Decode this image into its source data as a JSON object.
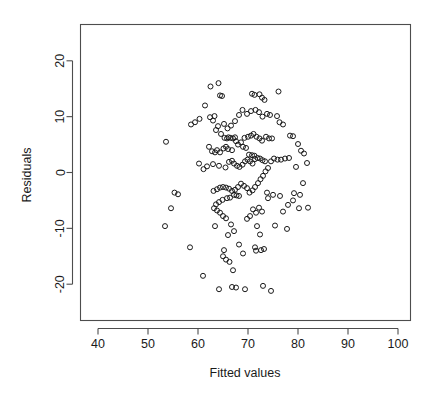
{
  "chart_data": {
    "type": "scatter",
    "title": "",
    "xlabel": "Fitted values",
    "ylabel": "Residuals",
    "xlim": [
      36.5,
      102.5
    ],
    "ylim": [
      -26.5,
      26.5
    ],
    "xticks": [
      40,
      50,
      60,
      70,
      80,
      90,
      100
    ],
    "yticks": [
      -20,
      -10,
      0,
      10,
      20
    ],
    "grid": false,
    "legend": null,
    "marker": "open-circle",
    "marker_color": "#1a1a1a",
    "n_points": 181,
    "points": [
      [
        53.6,
        5.5
      ],
      [
        55.3,
        -3.6
      ],
      [
        56.0,
        -3.9
      ],
      [
        54.6,
        -6.4
      ],
      [
        53.4,
        -9.6
      ],
      [
        58.4,
        -13.4
      ],
      [
        61.0,
        -18.5
      ],
      [
        58.6,
        8.6
      ],
      [
        59.4,
        9.0
      ],
      [
        60.3,
        9.6
      ],
      [
        61.4,
        12.0
      ],
      [
        62.5,
        15.4
      ],
      [
        63.3,
        10.1
      ],
      [
        62.4,
        9.9
      ],
      [
        63.0,
        9.3
      ],
      [
        64.1,
        16.0
      ],
      [
        64.4,
        13.8
      ],
      [
        64.8,
        13.7
      ],
      [
        65.2,
        8.7
      ],
      [
        64.0,
        8.3
      ],
      [
        63.6,
        7.6
      ],
      [
        64.6,
        6.9
      ],
      [
        65.3,
        6.2
      ],
      [
        65.8,
        6.1
      ],
      [
        66.1,
        6.3
      ],
      [
        66.5,
        6.2
      ],
      [
        67.0,
        6.1
      ],
      [
        67.4,
        6.3
      ],
      [
        62.2,
        4.6
      ],
      [
        62.8,
        3.8
      ],
      [
        63.4,
        3.6
      ],
      [
        63.8,
        4.0
      ],
      [
        64.4,
        3.6
      ],
      [
        65.1,
        4.3
      ],
      [
        65.6,
        4.6
      ],
      [
        66.0,
        4.2
      ],
      [
        66.8,
        4.0
      ],
      [
        60.2,
        1.6
      ],
      [
        61.1,
        0.6
      ],
      [
        61.8,
        1.1
      ],
      [
        63.0,
        1.5
      ],
      [
        64.2,
        1.2
      ],
      [
        65.5,
        0.9
      ],
      [
        66.2,
        1.9
      ],
      [
        66.8,
        2.1
      ],
      [
        67.2,
        1.6
      ],
      [
        67.8,
        1.2
      ],
      [
        68.3,
        1.0
      ],
      [
        68.9,
        1.4
      ],
      [
        69.4,
        2.0
      ],
      [
        69.9,
        2.3
      ],
      [
        70.4,
        2.0
      ],
      [
        70.9,
        1.6
      ],
      [
        71.4,
        2.4
      ],
      [
        71.9,
        2.6
      ],
      [
        72.4,
        2.5
      ],
      [
        72.9,
        2.2
      ],
      [
        73.4,
        2.0
      ],
      [
        69.0,
        4.6
      ],
      [
        69.6,
        4.4
      ],
      [
        70.2,
        3.2
      ],
      [
        70.8,
        3.1
      ],
      [
        71.3,
        3.0
      ],
      [
        68.0,
        5.0
      ],
      [
        67.6,
        5.6
      ],
      [
        68.6,
        5.4
      ],
      [
        69.3,
        6.2
      ],
      [
        70.0,
        6.4
      ],
      [
        70.6,
        6.6
      ],
      [
        71.1,
        6.9
      ],
      [
        71.7,
        6.4
      ],
      [
        72.3,
        6.1
      ],
      [
        72.8,
        5.7
      ],
      [
        73.6,
        6.4
      ],
      [
        74.2,
        6.1
      ],
      [
        74.8,
        6.1
      ],
      [
        78.4,
        6.6
      ],
      [
        79.0,
        6.5
      ],
      [
        77.0,
        8.6
      ],
      [
        75.8,
        10.1
      ],
      [
        76.3,
        9.0
      ],
      [
        74.4,
        10.3
      ],
      [
        73.8,
        10.5
      ],
      [
        72.9,
        10.0
      ],
      [
        72.2,
        10.8
      ],
      [
        71.5,
        11.2
      ],
      [
        70.6,
        11.0
      ],
      [
        69.8,
        10.5
      ],
      [
        68.9,
        11.2
      ],
      [
        68.2,
        10.3
      ],
      [
        67.4,
        9.2
      ],
      [
        66.6,
        8.4
      ],
      [
        65.9,
        7.9
      ],
      [
        70.8,
        14.1
      ],
      [
        71.3,
        13.9
      ],
      [
        72.3,
        14.0
      ],
      [
        72.8,
        13.4
      ],
      [
        73.3,
        13.0
      ],
      [
        76.1,
        14.5
      ],
      [
        80.0,
        5.1
      ],
      [
        80.6,
        3.9
      ],
      [
        81.2,
        3.4
      ],
      [
        81.8,
        1.7
      ],
      [
        79.6,
        1.0
      ],
      [
        78.2,
        2.6
      ],
      [
        77.4,
        2.5
      ],
      [
        76.6,
        2.3
      ],
      [
        75.9,
        2.3
      ],
      [
        75.2,
        2.5
      ],
      [
        74.6,
        2.0
      ],
      [
        74.0,
        0.8
      ],
      [
        73.5,
        0.2
      ],
      [
        73.0,
        -0.6
      ],
      [
        72.5,
        -1.2
      ],
      [
        72.0,
        -1.9
      ],
      [
        71.4,
        -2.6
      ],
      [
        70.9,
        -3.2
      ],
      [
        70.3,
        -3.6
      ],
      [
        69.8,
        -2.8
      ],
      [
        69.2,
        -2.4
      ],
      [
        68.6,
        -2.0
      ],
      [
        68.0,
        -2.6
      ],
      [
        67.4,
        -3.1
      ],
      [
        66.8,
        -3.3
      ],
      [
        66.2,
        -2.9
      ],
      [
        65.6,
        -2.7
      ],
      [
        65.0,
        -2.6
      ],
      [
        64.4,
        -2.7
      ],
      [
        63.8,
        -3.0
      ],
      [
        63.1,
        -3.3
      ],
      [
        67.2,
        -4.0
      ],
      [
        67.7,
        -4.1
      ],
      [
        68.2,
        -4.2
      ],
      [
        66.4,
        -4.5
      ],
      [
        65.8,
        -4.6
      ],
      [
        64.9,
        -4.9
      ],
      [
        64.2,
        -5.3
      ],
      [
        63.6,
        -5.7
      ],
      [
        63.2,
        -6.4
      ],
      [
        63.8,
        -6.8
      ],
      [
        64.4,
        -7.2
      ],
      [
        65.0,
        -7.8
      ],
      [
        65.6,
        -8.2
      ],
      [
        63.4,
        -9.6
      ],
      [
        66.6,
        -9.3
      ],
      [
        67.2,
        -10.5
      ],
      [
        66.0,
        -11.2
      ],
      [
        65.2,
        -13.9
      ],
      [
        65.0,
        -15.0
      ],
      [
        65.6,
        -15.6
      ],
      [
        66.3,
        -16.0
      ],
      [
        67.0,
        -17.5
      ],
      [
        64.2,
        -20.9
      ],
      [
        66.8,
        -20.5
      ],
      [
        67.6,
        -20.6
      ],
      [
        69.4,
        -20.9
      ],
      [
        73.0,
        -20.3
      ],
      [
        74.6,
        -21.2
      ],
      [
        69.0,
        -14.5
      ],
      [
        68.2,
        -12.9
      ],
      [
        69.8,
        -8.3
      ],
      [
        70.4,
        -7.8
      ],
      [
        71.0,
        -6.6
      ],
      [
        71.6,
        -7.2
      ],
      [
        72.2,
        -6.3
      ],
      [
        72.8,
        -7.0
      ],
      [
        71.8,
        -9.6
      ],
      [
        72.4,
        -11.1
      ],
      [
        71.4,
        -13.4
      ],
      [
        71.6,
        -14.0
      ],
      [
        72.6,
        -13.9
      ],
      [
        73.2,
        -13.7
      ],
      [
        75.4,
        -9.5
      ],
      [
        77.0,
        -7.0
      ],
      [
        77.8,
        -10.1
      ],
      [
        79.2,
        -3.7
      ],
      [
        80.4,
        -4.0
      ],
      [
        81.0,
        -1.9
      ],
      [
        80.2,
        -6.4
      ],
      [
        79.0,
        -5.0
      ],
      [
        78.0,
        -5.8
      ],
      [
        76.4,
        -4.2
      ],
      [
        82.0,
        -6.3
      ],
      [
        75.0,
        -4.0
      ],
      [
        74.0,
        -4.6
      ],
      [
        73.8,
        -3.6
      ]
    ]
  },
  "axes": {
    "x_tick_labels": [
      "40",
      "50",
      "60",
      "70",
      "80",
      "90",
      "100"
    ],
    "y_tick_labels": [
      "-20",
      "-10",
      "0",
      "10",
      "20"
    ],
    "x_title": "Fitted values",
    "y_title": "Residuals"
  },
  "colors": {
    "background": "#ffffff",
    "axis": "#4d4d4d",
    "point": "#1a1a1a",
    "text": "#1a1a1a"
  }
}
